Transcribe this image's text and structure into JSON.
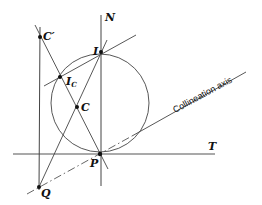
{
  "diagram": {
    "type": "geometric-construction",
    "labels": {
      "N": "N",
      "T": "T",
      "I": "I",
      "Ic_main": "I",
      "Ic_sub": "C",
      "C": "C",
      "C_prime": "C′",
      "P": "P",
      "Q": "Q",
      "axis": "Collineation axis"
    },
    "points": {
      "P": [
        100,
        154
      ],
      "I": [
        101,
        52
      ],
      "C_prime": [
        40,
        37
      ],
      "I_C": [
        60,
        77
      ],
      "C": [
        77,
        107
      ],
      "Q": [
        39,
        187
      ]
    },
    "circle": {
      "cx": 100,
      "cy": 103,
      "r": 49
    },
    "colors": {
      "stroke": "#333333",
      "text": "#111111",
      "background": "#ffffff"
    }
  }
}
